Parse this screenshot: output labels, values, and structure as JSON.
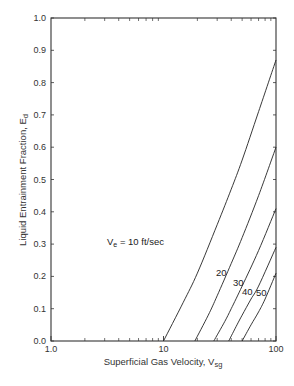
{
  "chart_data": {
    "type": "line",
    "title": "",
    "xlabel": "Superficial Gas Velocity, V",
    "xlabel_sub": "sg",
    "ylabel": "Liquid Entrainment Fraction, E",
    "ylabel_sub": "d",
    "xscale": "log",
    "xlim": [
      1,
      100
    ],
    "ylim": [
      0.0,
      1.0
    ],
    "grid": false,
    "x_ticks": [
      "1.0",
      "10",
      "100"
    ],
    "y_ticks": [
      "0.0",
      "0.1",
      "0.2",
      "0.3",
      "0.4",
      "0.5",
      "0.6",
      "0.7",
      "0.8",
      "0.9",
      "1.0"
    ],
    "series": [
      {
        "name": "Ve = 10 ft/sec",
        "label": "= 10 ft/sec",
        "label_prefix": "V",
        "label_sub": "e",
        "x": [
          10,
          15,
          20,
          30,
          40,
          50,
          70,
          100
        ],
        "y": [
          0.0,
          0.12,
          0.21,
          0.36,
          0.47,
          0.56,
          0.71,
          0.87
        ]
      },
      {
        "name": "20",
        "label": "20",
        "x": [
          19,
          25,
          30,
          40,
          50,
          70,
          100
        ],
        "y": [
          0.0,
          0.08,
          0.14,
          0.24,
          0.32,
          0.45,
          0.6
        ]
      },
      {
        "name": "30",
        "label": "30",
        "x": [
          28,
          35,
          40,
          50,
          70,
          100
        ],
        "y": [
          0.0,
          0.06,
          0.1,
          0.17,
          0.28,
          0.41
        ]
      },
      {
        "name": "40",
        "label": "40",
        "x": [
          38,
          45,
          50,
          60,
          70,
          100
        ],
        "y": [
          0.0,
          0.05,
          0.08,
          0.13,
          0.17,
          0.29
        ]
      },
      {
        "name": "50",
        "label": "50",
        "x": [
          50,
          60,
          70,
          80,
          100
        ],
        "y": [
          0.0,
          0.05,
          0.09,
          0.13,
          0.21
        ]
      }
    ],
    "annotations": [
      "Ve = 10 ft/sec",
      "20",
      "30",
      "40",
      "50"
    ]
  },
  "caption": "FIGURE 2.21   Liquid entrainment fraction vs. superficial gas velocity"
}
